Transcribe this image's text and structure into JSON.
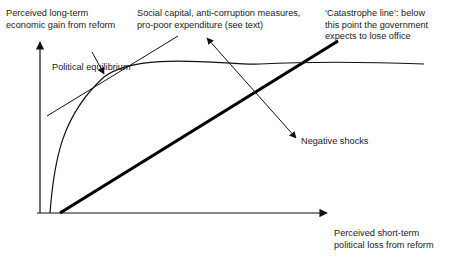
{
  "diagram": {
    "y_axis_label": "Perceived long-term\neconomic gain from reform",
    "x_axis_label": "Perceived short-term\npolitical loss from reform",
    "equilibrium_label": "Political equilibrium",
    "shift_up_label": "Social capital, anti-corruption measures,\npro-poor expenditure (see text)",
    "catastrophe_label": "‘Catastrophe line’: below\nthis point the government\nexpects to lose office",
    "shift_down_label": "Negative shocks"
  },
  "colors": {
    "line": "#111111",
    "background": "#ffffff"
  }
}
